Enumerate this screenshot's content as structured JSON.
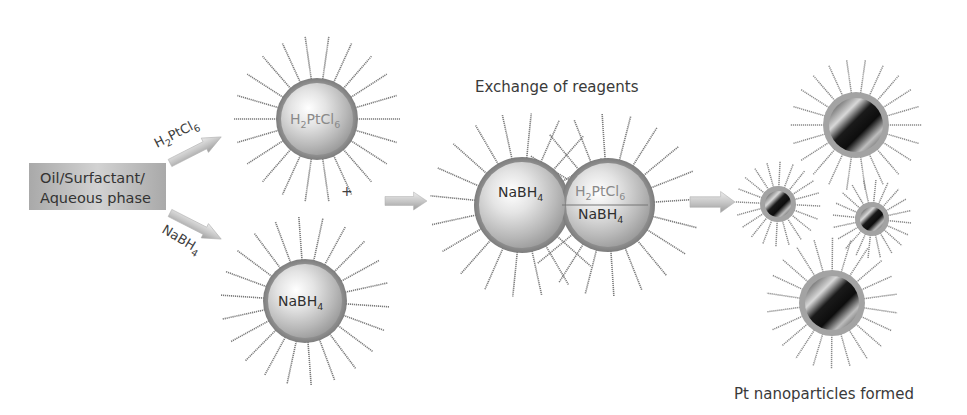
{
  "diagram": {
    "title_exchange": "Exchange of reagents",
    "caption_result": "Pt nanoparticles formed",
    "source_box": {
      "line1": "Oil/Surfactant/",
      "line2": "Aqueous phase"
    },
    "arrows": {
      "upper": {
        "label_main": "H",
        "label_sub1": "2",
        "label_mid": "PtCl",
        "label_sub2": "6"
      },
      "lower": {
        "label_main": "NaBH",
        "label_sub": "4"
      }
    },
    "micelle_top": {
      "label_main": "H",
      "label_sub1": "2",
      "label_mid": "PtCl",
      "label_sub2": "6",
      "marker": "+"
    },
    "micelle_bottom": {
      "label_main": "NaBH",
      "label_sub": "4"
    },
    "merged_micelle": {
      "left_label_main": "NaBH",
      "left_label_sub": "4",
      "right_top_main": "H",
      "right_top_sub1": "2",
      "right_top_mid": "PtCl",
      "right_top_sub2": "6",
      "right_bottom_main": "NaBH",
      "right_bottom_sub": "4"
    },
    "nanoparticles": [
      {
        "name": "large-top",
        "cx": 856,
        "cy": 125
      },
      {
        "name": "small-left",
        "cx": 778,
        "cy": 204
      },
      {
        "name": "small-right",
        "cx": 872,
        "cy": 219
      },
      {
        "name": "large-bottom",
        "cx": 832,
        "cy": 303
      }
    ],
    "colors": {
      "background": "#ffffff",
      "shell": "#8f8f8f",
      "tail": "#7a7a7a",
      "arrow": "#c8c8c8",
      "box": "#b5b5b5",
      "text": "#3a3a3a"
    }
  }
}
